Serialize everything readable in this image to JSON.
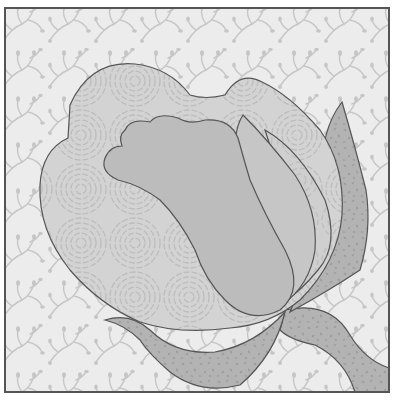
{
  "artwork": {
    "subject": "Rose bud quilt block",
    "style": "grayscale appliqué quilt pattern",
    "frame": {
      "x": 5,
      "y": 8,
      "width": 384,
      "height": 384,
      "stroke": "#555555"
    },
    "colors": {
      "background": "#ececec",
      "background_vine": "#c9c9c9",
      "outer_petal": "#d3d3d3",
      "outer_petal_swirl": "#bdbdbd",
      "inner_petal": "#bcbcbc",
      "mid_petal": "#c6c6c6",
      "side_petal": "#cfcfcf",
      "leaf": "#b3b3b3",
      "leaf_speckle": "#9a9a9a",
      "outline": "#555555"
    },
    "elements": [
      {
        "name": "background-vine-fabric",
        "pattern": "vines"
      },
      {
        "name": "outer-petal",
        "pattern": "concentric-swirls"
      },
      {
        "name": "inner-petal-center",
        "pattern": "solid"
      },
      {
        "name": "middle-petal",
        "pattern": "solid"
      },
      {
        "name": "right-swirl-petal",
        "pattern": "concentric-swirls"
      },
      {
        "name": "sepal-right-upper",
        "pattern": "speckled"
      },
      {
        "name": "sepal-bottom-left",
        "pattern": "speckled"
      },
      {
        "name": "stem-bottom-right",
        "pattern": "speckled"
      }
    ]
  }
}
